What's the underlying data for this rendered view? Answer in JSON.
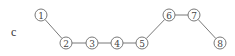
{
  "panel": {
    "label": "c"
  },
  "nodes": [
    {
      "id": "1",
      "label": "1",
      "x": 41,
      "y": 15
    },
    {
      "id": "2",
      "label": "2",
      "x": 66,
      "y": 43
    },
    {
      "id": "3",
      "label": "3",
      "x": 92,
      "y": 43
    },
    {
      "id": "4",
      "label": "4",
      "x": 117,
      "y": 43
    },
    {
      "id": "5",
      "label": "5",
      "x": 142,
      "y": 43
    },
    {
      "id": "6",
      "label": "6",
      "x": 169,
      "y": 15
    },
    {
      "id": "7",
      "label": "7",
      "x": 194,
      "y": 15
    },
    {
      "id": "8",
      "label": "8",
      "x": 220,
      "y": 43
    }
  ],
  "edges": [
    [
      "1",
      "2"
    ],
    [
      "2",
      "3"
    ],
    [
      "3",
      "4"
    ],
    [
      "4",
      "5"
    ],
    [
      "5",
      "6"
    ],
    [
      "6",
      "7"
    ],
    [
      "7",
      "8"
    ]
  ],
  "style": {
    "stroke": "#6a6a6a",
    "node_radius": 6
  }
}
